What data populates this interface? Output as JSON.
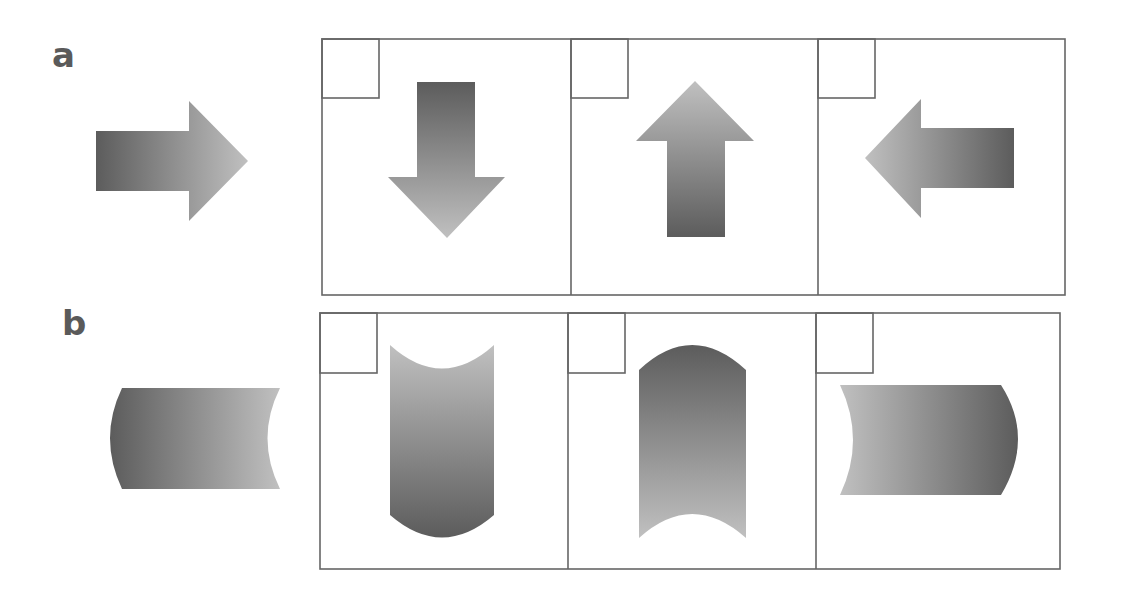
{
  "panels": [
    {
      "label": "a",
      "reference_shape": "arrow-right",
      "options": [
        "arrow-down",
        "arrow-up",
        "arrow-left"
      ]
    },
    {
      "label": "b",
      "reference_shape": "cylinder-right-concave",
      "options": [
        "cylinder-vertical-concave-top",
        "cylinder-vertical-concave-bottom",
        "cylinder-left-concave"
      ]
    }
  ],
  "colors": {
    "dark": "#5c5c5c",
    "light": "#bdbdbd",
    "border": "#666666",
    "label": "#5a5a5a"
  }
}
